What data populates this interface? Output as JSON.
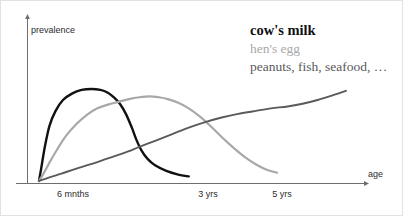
{
  "chart_data": {
    "type": "line",
    "title": "",
    "xlabel": "age",
    "ylabel": "prevalence",
    "grid": false,
    "legend_position": "top-right",
    "x_tick_labels": [
      "6 mnths",
      "3 yrs",
      "5 yrs"
    ],
    "y_tick_labels": [],
    "axis_style": "arrowed-schematic",
    "note": "Schematic curves; vertical axis unlabeled (relative prevalence)",
    "series": [
      {
        "name": "cow's milk",
        "color": "#111111",
        "x": [
          0,
          3,
          8,
          14,
          22,
          32,
          44,
          57,
          70,
          82,
          92,
          100,
          108,
          116,
          124,
          130,
          137,
          145,
          155,
          170,
          186,
          200
        ],
        "y": [
          0,
          14,
          38,
          60,
          76,
          88,
          95,
          99,
          100,
          99,
          96,
          91,
          84,
          73,
          58,
          45,
          33,
          24,
          17,
          11,
          7,
          5
        ]
      },
      {
        "name": "hen's egg",
        "color": "#a8a8a8",
        "x": [
          0,
          6,
          14,
          24,
          36,
          50,
          64,
          78,
          92,
          106,
          120,
          134,
          148,
          160,
          172,
          186,
          200,
          215,
          230,
          245,
          260,
          275,
          290,
          305,
          318
        ],
        "y": [
          0,
          8,
          20,
          34,
          49,
          62,
          72,
          79,
          83,
          86,
          89,
          91,
          92,
          91,
          89,
          85,
          79,
          70,
          59,
          47,
          36,
          26,
          18,
          12,
          9
        ]
      },
      {
        "name": "peanuts, fish, seafood, …",
        "color": "#5a5a5a",
        "x": [
          0,
          14,
          30,
          48,
          68,
          90,
          112,
          134,
          156,
          178,
          200,
          222,
          244,
          266,
          288,
          310,
          332,
          352,
          372,
          392,
          410
        ],
        "y": [
          0,
          4,
          8,
          13,
          18,
          24,
          30,
          37,
          44,
          51,
          58,
          64,
          69,
          73,
          76,
          79,
          81,
          84,
          88,
          93,
          98
        ]
      }
    ]
  },
  "legend": {
    "entries": [
      "cow's milk",
      "hen's egg",
      "peanuts, fish, seafood, …"
    ]
  }
}
